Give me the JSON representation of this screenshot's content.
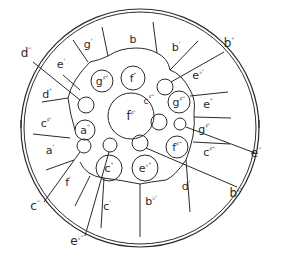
{
  "diagram": {
    "type": "steel-pan-note-layout",
    "colors": {
      "ink": "#2a2a2a",
      "background": "#ffffff"
    },
    "outer_ring_notes": [
      {
        "id": "g1",
        "note": "g",
        "mark": "'",
        "x": 88,
        "y": 48
      },
      {
        "id": "b",
        "note": "b",
        "mark": "",
        "x": 133,
        "y": 43
      },
      {
        "id": "b1",
        "note": "b",
        "mark": "'",
        "x": 176,
        "y": 51
      },
      {
        "id": "eflat1",
        "note": "e",
        "mark": "♭'",
        "x": 198,
        "y": 79
      },
      {
        "id": "e2",
        "note": "e",
        "mark": "\"",
        "x": 208,
        "y": 108
      },
      {
        "id": "gsharp1",
        "note": "g",
        "mark": "♯'",
        "x": 204,
        "y": 133
      },
      {
        "id": "csharp2",
        "note": "c",
        "mark": "♯\"",
        "x": 209,
        "y": 156
      },
      {
        "id": "d1",
        "note": "d",
        "mark": "'",
        "x": 186,
        "y": 190
      },
      {
        "id": "bflat1",
        "note": "b",
        "mark": "♭'",
        "x": 151,
        "y": 205
      },
      {
        "id": "c1",
        "note": "c",
        "mark": "'",
        "x": 107,
        "y": 210
      },
      {
        "id": "f1",
        "note": "f",
        "mark": "'",
        "x": 68,
        "y": 186
      },
      {
        "id": "a1",
        "note": "a",
        "mark": "'",
        "x": 50,
        "y": 154
      },
      {
        "id": "csharp1",
        "note": "c",
        "mark": "♯'",
        "x": 46,
        "y": 127
      },
      {
        "id": "d2",
        "note": "d",
        "mark": "\"",
        "x": 47,
        "y": 98
      },
      {
        "id": "e1",
        "note": "e",
        "mark": "'",
        "x": 61,
        "y": 68
      }
    ],
    "inner_circle_notes": [
      {
        "id": "gsharp2",
        "note": "g",
        "mark": "♯\"",
        "cx": 102,
        "cy": 81,
        "r": 11
      },
      {
        "id": "f2",
        "note": "f",
        "mark": "\"",
        "cx": 133,
        "cy": 78,
        "r": 12
      },
      {
        "id": "fsharp1_center",
        "note": "f",
        "mark": "♯'",
        "cx": 131,
        "cy": 116,
        "r": 23
      },
      {
        "id": "gsharp3",
        "note": "g",
        "mark": "♯‴",
        "cx": 179,
        "cy": 102,
        "r": 11
      },
      {
        "id": "a2",
        "note": "a",
        "mark": "\"",
        "cx": 85,
        "cy": 130,
        "r": 10
      },
      {
        "id": "c2",
        "note": "c",
        "mark": "\"",
        "cx": 109,
        "cy": 168,
        "r": 13
      },
      {
        "id": "eflat2",
        "note": "e",
        "mark": "♭\"",
        "cx": 145,
        "cy": 168,
        "r": 13
      },
      {
        "id": "fsharp2",
        "note": "f",
        "mark": "♯\"",
        "cx": 177,
        "cy": 147,
        "r": 11
      }
    ],
    "small_unlabeled_circles": [
      {
        "id": "d3_target",
        "cx": 86,
        "cy": 105,
        "r": 8
      },
      {
        "id": "b2_target",
        "cx": 165,
        "cy": 87,
        "r": 8
      },
      {
        "id": "csharp3_target",
        "cx": 159,
        "cy": 122,
        "r": 8
      },
      {
        "id": "e3_target",
        "cx": 180,
        "cy": 124,
        "r": 6
      },
      {
        "id": "c3_target",
        "cx": 84,
        "cy": 146,
        "r": 7
      },
      {
        "id": "eflat3_target",
        "cx": 110,
        "cy": 145,
        "r": 7
      },
      {
        "id": "bflat2_target",
        "cx": 140,
        "cy": 143,
        "r": 8
      }
    ],
    "inner_labels": [
      {
        "id": "csharp3_label",
        "note": "c",
        "mark": "♯‴",
        "x": 149,
        "y": 104
      }
    ],
    "callout_labels": [
      {
        "id": "d3",
        "note": "d",
        "mark": "‴",
        "x": 26,
        "y": 57,
        "line": [
          33,
          62,
          80,
          100
        ]
      },
      {
        "id": "b2",
        "note": "b",
        "mark": "\"",
        "x": 229,
        "y": 47,
        "line": [
          224,
          52,
          171,
          82
        ]
      },
      {
        "id": "e3",
        "note": "e",
        "mark": "‴",
        "x": 256,
        "y": 157,
        "line": [
          255,
          153,
          186,
          127
        ]
      },
      {
        "id": "bflat2",
        "note": "b",
        "mark": "♭\"",
        "x": 236,
        "y": 197,
        "line": [
          237,
          187,
          146,
          148
        ]
      },
      {
        "id": "c3",
        "note": "c",
        "mark": "‴",
        "x": 35,
        "y": 210,
        "line": [
          44,
          202,
          80,
          152
        ]
      },
      {
        "id": "eflat3",
        "note": "e",
        "mark": "♭‴",
        "x": 77,
        "y": 245,
        "line": [
          85,
          236,
          109,
          152
        ]
      }
    ]
  }
}
